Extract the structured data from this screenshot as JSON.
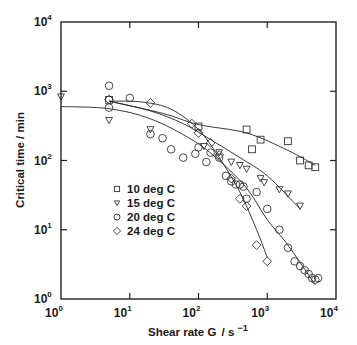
{
  "chart_data": {
    "type": "scatter",
    "title": "",
    "xlabel": "Shear rate  G / s⁻¹",
    "ylabel": "Critical time / min",
    "xscale": "log",
    "yscale": "log",
    "xlim": [
      1,
      10000
    ],
    "ylim": [
      1,
      10000
    ],
    "x_ticks": [
      {
        "value": 1,
        "base": "10",
        "exp": "0"
      },
      {
        "value": 10,
        "base": "10",
        "exp": "1"
      },
      {
        "value": 100,
        "base": "10",
        "exp": "2"
      },
      {
        "value": 1000,
        "base": "10",
        "exp": "3"
      },
      {
        "value": 10000,
        "base": "10",
        "exp": "4"
      }
    ],
    "y_ticks": [
      {
        "value": 1,
        "base": "10",
        "exp": "0"
      },
      {
        "value": 10,
        "base": "10",
        "exp": "1"
      },
      {
        "value": 100,
        "base": "10",
        "exp": "2"
      },
      {
        "value": 1000,
        "base": "10",
        "exp": "3"
      },
      {
        "value": 10000,
        "base": "10",
        "exp": "4"
      }
    ],
    "grid": false,
    "legend_position": "inside-lower-left",
    "series": [
      {
        "name": "10 deg C",
        "marker": "square",
        "points": [
          [
            5,
            750
          ],
          [
            100,
            310
          ],
          [
            500,
            280
          ],
          [
            600,
            145
          ],
          [
            800,
            200
          ],
          [
            2000,
            190
          ],
          [
            3000,
            100
          ],
          [
            4000,
            85
          ],
          [
            5000,
            80
          ]
        ],
        "curve": [
          [
            5,
            720
          ],
          [
            30,
            480
          ],
          [
            100,
            330
          ],
          [
            500,
            250
          ],
          [
            2000,
            140
          ],
          [
            5000,
            85
          ]
        ]
      },
      {
        "name": "15 deg C",
        "marker": "triangle-down",
        "points": [
          [
            1,
            830
          ],
          [
            5,
            380
          ],
          [
            20,
            280
          ],
          [
            120,
            160
          ],
          [
            200,
            130
          ],
          [
            300,
            95
          ],
          [
            400,
            85
          ],
          [
            500,
            75
          ],
          [
            800,
            55
          ],
          [
            900,
            48
          ],
          [
            1500,
            38
          ],
          [
            2000,
            33
          ],
          [
            3000,
            22
          ]
        ],
        "curve": [
          [
            5,
            720
          ],
          [
            20,
            520
          ],
          [
            60,
            340
          ],
          [
            150,
            200
          ],
          [
            400,
            110
          ],
          [
            1000,
            60
          ],
          [
            3000,
            20
          ]
        ]
      },
      {
        "name": "20 deg C",
        "marker": "circle",
        "points": [
          [
            5,
            1200
          ],
          [
            5,
            580
          ],
          [
            10,
            800
          ],
          [
            20,
            240
          ],
          [
            30,
            210
          ],
          [
            40,
            145
          ],
          [
            60,
            110
          ],
          [
            90,
            125
          ],
          [
            100,
            155
          ],
          [
            130,
            95
          ],
          [
            150,
            130
          ],
          [
            200,
            110
          ],
          [
            250,
            60
          ],
          [
            300,
            50
          ],
          [
            350,
            45
          ],
          [
            400,
            45
          ],
          [
            450,
            42
          ],
          [
            500,
            28
          ],
          [
            700,
            35
          ],
          [
            1000,
            20
          ],
          [
            1500,
            10
          ],
          [
            2000,
            5.5
          ],
          [
            2500,
            3.5
          ],
          [
            3000,
            3
          ],
          [
            3500,
            2.6
          ],
          [
            4000,
            2.3
          ],
          [
            4500,
            2
          ],
          [
            5000,
            1.9
          ],
          [
            5500,
            2
          ]
        ],
        "curve": [
          [
            1,
            600
          ],
          [
            5,
            560
          ],
          [
            20,
            400
          ],
          [
            80,
            200
          ],
          [
            200,
            100
          ],
          [
            500,
            40
          ],
          [
            1000,
            14
          ],
          [
            2000,
            6
          ],
          [
            5000,
            1.6
          ]
        ]
      },
      {
        "name": "24 deg C",
        "marker": "diamond",
        "points": [
          [
            5,
            760
          ],
          [
            20,
            680
          ],
          [
            80,
            340
          ],
          [
            100,
            250
          ],
          [
            150,
            180
          ],
          [
            200,
            120
          ],
          [
            300,
            55
          ],
          [
            400,
            28
          ],
          [
            500,
            22
          ],
          [
            700,
            6
          ],
          [
            1000,
            3.5
          ]
        ],
        "curve": [
          [
            5,
            720
          ],
          [
            15,
            700
          ],
          [
            40,
            550
          ],
          [
            100,
            280
          ],
          [
            200,
            110
          ],
          [
            400,
            35
          ],
          [
            700,
            10
          ],
          [
            1000,
            4
          ]
        ]
      }
    ]
  },
  "legend": {
    "items": [
      {
        "label": "10 deg C",
        "marker": "square"
      },
      {
        "label": "15 deg C",
        "marker": "triangle-down"
      },
      {
        "label": "20 deg C",
        "marker": "circle"
      },
      {
        "label": "24 deg C",
        "marker": "diamond"
      }
    ]
  },
  "axes": {
    "xlabel_main": "Shear rate  G",
    "xlabel_unit": "/ s",
    "xlabel_exp": "−1",
    "ylabel": "Critical time / min"
  },
  "colors": {
    "ink": "#1a1a1a",
    "background": "#ffffff"
  }
}
